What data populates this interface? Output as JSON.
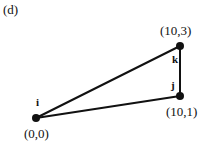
{
  "panel_label": "(d)",
  "nodes": [
    {
      "id": "i",
      "label": "i",
      "coord": "(0,0)",
      "x": 36,
      "y": 118
    },
    {
      "id": "j",
      "label": "j",
      "coord": "(10,1)",
      "x": 180,
      "y": 96
    },
    {
      "id": "k",
      "label": "k",
      "coord": "(10,3)",
      "x": 180,
      "y": 46
    }
  ],
  "edges": [
    {
      "from": "i",
      "to": "k"
    },
    {
      "from": "i",
      "to": "j"
    },
    {
      "from": "j",
      "to": "k"
    }
  ]
}
